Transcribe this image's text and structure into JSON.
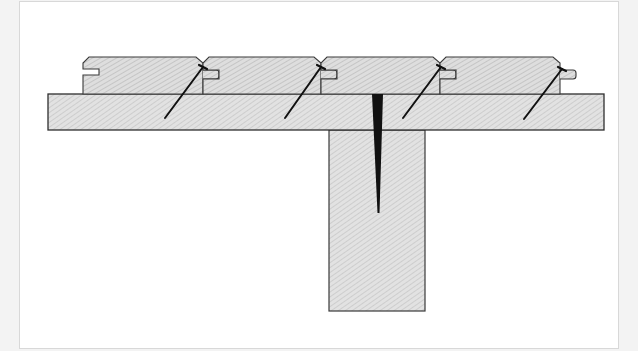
{
  "diagram": {
    "colors": {
      "background": "#f3f3f3",
      "frame": "#ffffff",
      "frame_border": "#d8d8d8",
      "wood_fill": "#dcdcdc",
      "hatch": "#b8b8b8",
      "outline": "#3a3a3a",
      "nail": "#111111"
    },
    "components": [
      {
        "name": "floorboard",
        "count": 4,
        "detail": "tongue-and-groove profile with chamfered top edges"
      },
      {
        "name": "subfloor",
        "count": 1
      },
      {
        "name": "joist",
        "count": 1
      },
      {
        "name": "secret-nail",
        "count": 4,
        "detail": "angled nails driven through tongues into subfloor"
      },
      {
        "name": "subfloor-nail",
        "count": 1,
        "detail": "vertical nail through subfloor into joist"
      }
    ]
  }
}
